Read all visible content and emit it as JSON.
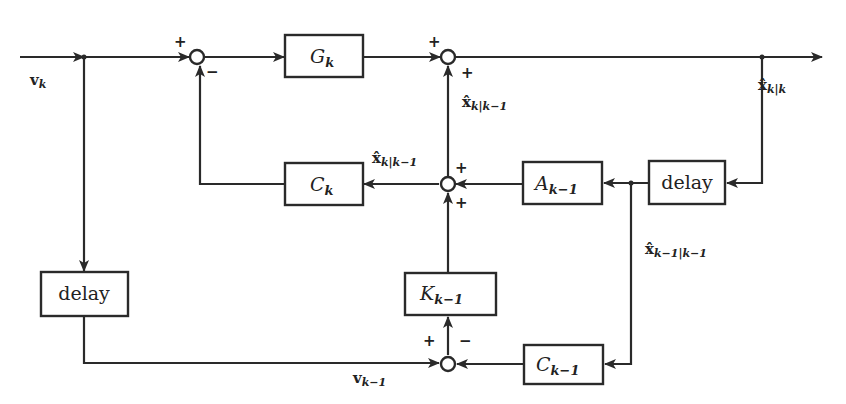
{
  "diagram": {
    "type": "block-diagram",
    "blocks": [
      {
        "id": "G",
        "label": "G",
        "sub": "k"
      },
      {
        "id": "C",
        "label": "C",
        "sub": "k"
      },
      {
        "id": "A",
        "label": "A",
        "sub": "k−1"
      },
      {
        "id": "delay_right",
        "label": "delay",
        "sub": ""
      },
      {
        "id": "delay_left",
        "label": "delay",
        "sub": ""
      },
      {
        "id": "K",
        "label": "K",
        "sub": "k−1"
      },
      {
        "id": "C_prev",
        "label": "C",
        "sub": "k−1"
      }
    ],
    "signals": {
      "input": {
        "base": "v",
        "sub": "k"
      },
      "output": {
        "base": "x̂",
        "sub": "k|k"
      },
      "predicted_up": {
        "base": "x̂",
        "sub": "k|k−1"
      },
      "predicted_left": {
        "base": "x̂",
        "sub": "k|k−1"
      },
      "previous_estimate": {
        "base": "x̂",
        "sub": "k−1|k−1"
      },
      "delayed_input": {
        "base": "v",
        "sub": "k−1"
      }
    },
    "signs": {
      "sum1_top": "+",
      "sum1_bottom": "−",
      "sum2_top": "+",
      "sum2_bottom": "+",
      "sum3_top": "+",
      "sum3_bottom": "+",
      "sum4_left": "+",
      "sum4_right": "−"
    }
  }
}
